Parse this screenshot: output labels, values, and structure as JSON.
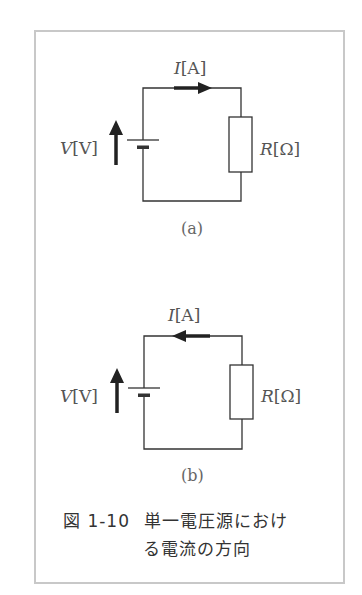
{
  "figure": {
    "number": "図 1-10",
    "caption_line1": "単一電圧源におけ",
    "caption_line2": "る電流の方向",
    "border_color": "#c8c8c8"
  },
  "circuit_a": {
    "sub_label": "(a)",
    "voltage_symbol": "V",
    "voltage_unit": "[V]",
    "current_symbol": "I",
    "current_unit": "[A]",
    "resistance_symbol": "R",
    "resistance_unit": "[Ω]",
    "current_direction": "right (clockwise)",
    "voltage_arrow_direction": "up"
  },
  "circuit_b": {
    "sub_label": "(b)",
    "voltage_symbol": "V",
    "voltage_unit": "[V]",
    "current_symbol": "I",
    "current_unit": "[A]",
    "resistance_symbol": "R",
    "resistance_unit": "[Ω]",
    "current_direction": "left (counter-clockwise)",
    "voltage_arrow_direction": "up"
  }
}
